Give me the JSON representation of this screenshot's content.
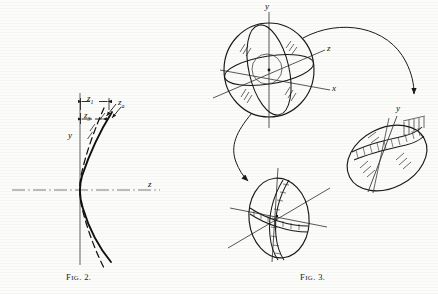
{
  "page": {
    "background": "#fcfcfa",
    "ink": "#1a1a1a"
  },
  "figure2": {
    "caption_prefix": "F",
    "caption_smallcaps": "IG",
    "caption_suffix": ". 2.",
    "caption_full": "FIG. 2.",
    "axis_y_label": "y",
    "axis_z_label": "z",
    "dim_z1_label": "z",
    "dim_z1_sub": "1",
    "dim_z3_label": "z",
    "dim_z3_sub": "3",
    "dim_za_label": "z",
    "dim_za_sub": "a",
    "curve_solid_name": "aspheric-surface-profile",
    "curve_dashed_name": "reference-sphere-profile",
    "axis_style": "dash-dot"
  },
  "figure3": {
    "caption_prefix": "F",
    "caption_smallcaps": "IG",
    "caption_suffix": ". 3.",
    "caption_full": "FIG. 3.",
    "sphere": {
      "axis_x_label": "x",
      "axis_y_label": "y",
      "axis_z_label": "z",
      "name": "reference-sphere-three-axes"
    },
    "lower_view": {
      "name": "tilted-ellipse-zone-view"
    },
    "right_view": {
      "axis_y_label": "y",
      "name": "rotated-disk-hatched-band-view"
    },
    "arrows": [
      {
        "name": "arrow-sphere-to-right-disk"
      },
      {
        "name": "arrow-sphere-to-lower-ellipse"
      }
    ]
  }
}
